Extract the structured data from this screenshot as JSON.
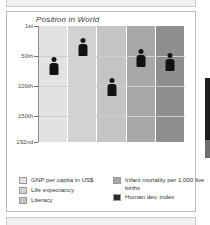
{
  "chart_data": {
    "type": "bar",
    "title": "Position in World",
    "xlabel": "",
    "ylabel": "",
    "ylim": [
      1,
      192
    ],
    "grid": true,
    "legend_position": "bottom",
    "ytick_labels": [
      "1st",
      "50th",
      "100th",
      "150th",
      "192nd"
    ],
    "ytick_values": [
      1,
      50,
      100,
      150,
      192
    ],
    "categories": [
      "GNP per capita in US$",
      "Life expectancy",
      "Literacy",
      "Infant mortality per 1,000 live births",
      "Human dev. index"
    ],
    "values": [
      81,
      51,
      117,
      69,
      75
    ],
    "value_labels": [
      "81",
      "51",
      "117",
      "69",
      "75"
    ],
    "sub_labels": [
      "$2420",
      "73",
      "82%",
      "18",
      ""
    ],
    "sub_labels2": [
      "",
      "years",
      "",
      "deaths",
      ""
    ],
    "series": [
      {
        "name": "Position in World",
        "points": [
          {
            "category": "GNP per capita in US$",
            "rank": 81,
            "label": "81",
            "sub": "$2420",
            "sub2": ""
          },
          {
            "category": "Life expectancy",
            "rank": 51,
            "label": "51",
            "sub": "73",
            "sub2": "years"
          },
          {
            "category": "Literacy",
            "rank": 117,
            "label": "117",
            "sub": "82%",
            "sub2": ""
          },
          {
            "category": "Infant mortality per 1,000 live births",
            "rank": 69,
            "label": "69",
            "sub": "18",
            "sub2": "deaths"
          },
          {
            "category": "Human dev. index",
            "rank": 75,
            "label": "75",
            "sub": "",
            "sub2": ""
          }
        ]
      }
    ],
    "column_colors": [
      "#e2e2e2",
      "#d2d2d2",
      "#c4c4c4",
      "#a8a8a8",
      "#8e8e8e"
    ],
    "marker": "person-pictogram"
  },
  "chart": {
    "title": "Position in World",
    "axis": {
      "ticks": [
        {
          "label": "1st",
          "value": 1
        },
        {
          "label": "50th",
          "value": 50
        },
        {
          "label": "100th",
          "value": 100
        },
        {
          "label": "150th",
          "value": 150
        },
        {
          "label": "192nd",
          "value": 192
        }
      ]
    },
    "columns": [
      {
        "label": "81",
        "sub": "$2420",
        "sub2": "",
        "rank": 81,
        "color": "#e2e2e2"
      },
      {
        "label": "51",
        "sub": "73",
        "sub2": "years",
        "rank": 51,
        "color": "#d2d2d2"
      },
      {
        "label": "117",
        "sub": "82%",
        "sub2": "",
        "rank": 117,
        "color": "#c4c4c4"
      },
      {
        "label": "69",
        "sub": "18",
        "sub2": "deaths",
        "rank": 69,
        "color": "#a8a8a8"
      },
      {
        "label": "75",
        "sub": "",
        "sub2": "",
        "rank": 75,
        "color": "#8e8e8e"
      }
    ]
  },
  "legend": {
    "left": [
      {
        "label": "GNP per capita in US$",
        "color": "#e2e2e2"
      },
      {
        "label": "Life expectancy",
        "color": "#d2d2d2"
      },
      {
        "label": "Literacy",
        "color": "#c4c4c4"
      }
    ],
    "right": [
      {
        "label": "Infant mortality per 1,000 live births",
        "color": "#a8a8a8"
      },
      {
        "label": "Human dev. index",
        "color": "#2a2a2a"
      }
    ]
  }
}
